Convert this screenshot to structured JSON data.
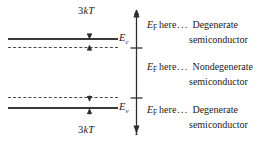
{
  "figure": {
    "type": "semiconductor-band-diagram",
    "ink_color": "#3a3a3a",
    "background": "#ffffff"
  },
  "bands": {
    "conduction": {
      "edge_label_symbol": "E",
      "edge_label_subscript": "c",
      "solid_line_name": "conduction-band-edge",
      "dashed_line_name": "conduction-degeneracy-limit"
    },
    "valence": {
      "edge_label_symbol": "E",
      "edge_label_subscript": "v",
      "solid_line_name": "valence-band-edge",
      "dashed_line_name": "valence-degeneracy-limit"
    }
  },
  "gap_annotations": {
    "top": {
      "prefix": "3",
      "k": "k",
      "T": "T",
      "full": "3kT"
    },
    "bottom": {
      "prefix": "3",
      "k": "k",
      "T": "T",
      "full": "3kT"
    }
  },
  "axis": {
    "name": "fermi-level-axis",
    "arrow_top": true,
    "arrow_bottom": true,
    "tick_count": 2
  },
  "notes": [
    {
      "symbol": "E",
      "subscript": "F",
      "here": "here",
      "dots": "...",
      "line1": "Degenerate",
      "line2": "semiconductor",
      "region": "above-conduction-degeneracy-limit"
    },
    {
      "symbol": "E",
      "subscript": "F",
      "here": "here",
      "dots": "...",
      "line1": "Nondegenerate",
      "line2": "semiconductor",
      "region": "between-limits"
    },
    {
      "symbol": "E",
      "subscript": "F",
      "here": "here",
      "dots": "...",
      "line1": "Degenerate",
      "line2": "semiconductor",
      "region": "below-valence-degeneracy-limit"
    }
  ]
}
